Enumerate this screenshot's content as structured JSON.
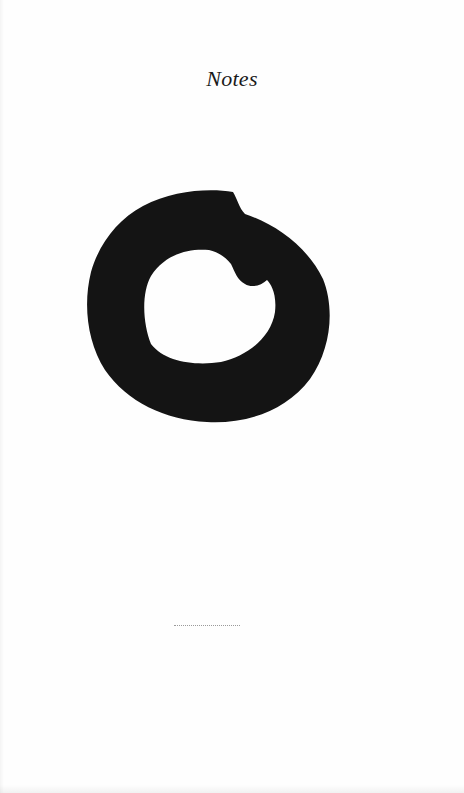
{
  "page": {
    "title": "Notes",
    "figure": {
      "description": "brushed black ring (ensō)",
      "color": "#141414",
      "background": "#fefefe"
    },
    "separator": "dotted-rule"
  }
}
